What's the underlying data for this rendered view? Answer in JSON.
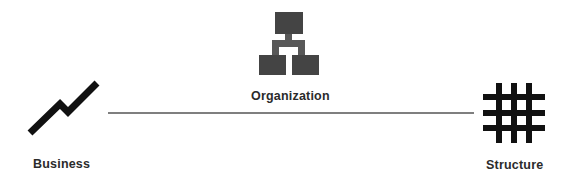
{
  "diagram": {
    "nodes": [
      {
        "id": "business",
        "label": "Business",
        "icon": "zigzag-trend-icon"
      },
      {
        "id": "organization",
        "label": "Organization",
        "icon": "org-chart-icon"
      },
      {
        "id": "structure",
        "label": "Structure",
        "icon": "grid-hash-icon"
      }
    ],
    "edges": [
      {
        "from": "business",
        "to": "structure"
      }
    ],
    "colors": {
      "icon_dark": "#111111",
      "org_box": "#444444",
      "org_connector": "#585858",
      "connector_line": "#555555",
      "label_text": "#2b2b2b"
    }
  }
}
